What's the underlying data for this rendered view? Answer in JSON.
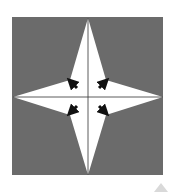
{
  "diagram": {
    "type": "four-pointed-star",
    "background_square": {
      "x": 12,
      "y": 17,
      "width": 151,
      "height": 158,
      "color": "#6b6b6b"
    },
    "star": {
      "color": "#ffffff",
      "center": [
        88,
        97
      ],
      "tips": {
        "top": [
          88,
          18
        ],
        "right": [
          163,
          97
        ],
        "bottom": [
          88,
          175
        ],
        "left": [
          13,
          97
        ]
      },
      "inner_vertices": {
        "top_left": [
          70,
          80
        ],
        "top_right": [
          106,
          80
        ],
        "bottom_right": [
          106,
          115
        ],
        "bottom_left": [
          70,
          115
        ]
      }
    },
    "cross_lines": {
      "color": "#333333"
    },
    "arrows": {
      "color": "#111111",
      "items": [
        {
          "name": "arrow-top-left",
          "direction": "up-left"
        },
        {
          "name": "arrow-top-right",
          "direction": "up-right"
        },
        {
          "name": "arrow-bottom-left",
          "direction": "down-left"
        },
        {
          "name": "arrow-bottom-right",
          "direction": "down-right"
        }
      ]
    }
  },
  "scroll_top": {
    "icon": "triangle-up-icon",
    "color": "#d9d9d9"
  }
}
